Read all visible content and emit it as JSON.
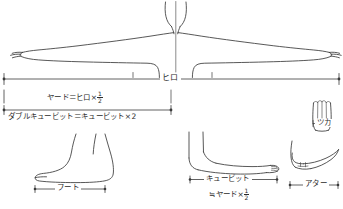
{
  "diagram": {
    "ink_color": "#3a3a3a",
    "text_color": "#2b2b2b"
  },
  "measures": {
    "fathom": {
      "label": "ヒロ",
      "name": "fathom-hiro"
    },
    "yard": {
      "label": "ヤード＝ヒロ×",
      "numerator": "1",
      "denominator": "2",
      "name": "yard-equation"
    },
    "double_cubit": {
      "label": "ダブルキュービット＝キュービット×2",
      "name": "double-cubit-equation"
    },
    "foot": {
      "label": "フート",
      "name": "foot-huto"
    },
    "cubit": {
      "label": "キュービット",
      "sublabel": "≒ヤード×",
      "numerator": "1",
      "denominator": "2",
      "name": "cubit-kyubitto"
    },
    "hand": {
      "label": "ツカ",
      "name": "hand-tsuka"
    },
    "span": {
      "label": "アター",
      "name": "span-ata"
    }
  }
}
